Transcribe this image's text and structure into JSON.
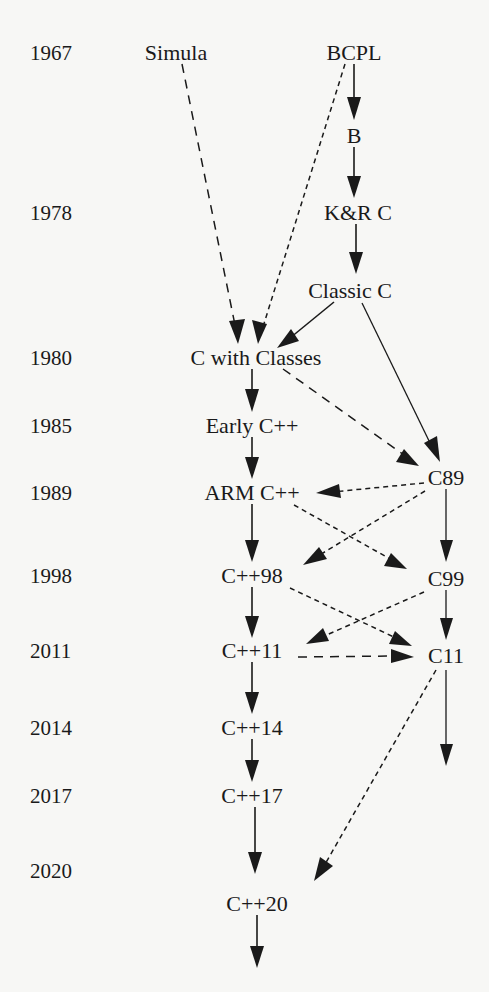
{
  "page": {
    "background_color": "#f7f7f5",
    "ink_color": "#1a1a1a",
    "width": 489,
    "height": 992
  },
  "years": [
    {
      "label": "1967",
      "x": 30,
      "y": 52
    },
    {
      "label": "1978",
      "x": 30,
      "y": 212
    },
    {
      "label": "1980",
      "x": 30,
      "y": 357
    },
    {
      "label": "1985",
      "x": 30,
      "y": 425
    },
    {
      "label": "1989",
      "x": 30,
      "y": 492
    },
    {
      "label": "1998",
      "x": 30,
      "y": 575
    },
    {
      "label": "2011",
      "x": 30,
      "y": 650
    },
    {
      "label": "2014",
      "x": 30,
      "y": 727
    },
    {
      "label": "2017",
      "x": 30,
      "y": 795
    },
    {
      "label": "2020",
      "x": 30,
      "y": 870
    }
  ],
  "nodes": [
    {
      "id": "simula",
      "label": "Simula",
      "cx": 176,
      "cy": 52,
      "column": "left"
    },
    {
      "id": "bcpl",
      "label": "BCPL",
      "cx": 354,
      "cy": 52,
      "column": "right"
    },
    {
      "id": "b",
      "label": "B",
      "cx": 354,
      "cy": 135,
      "column": "right"
    },
    {
      "id": "kandrc",
      "label": "K&R C",
      "cx": 358,
      "cy": 212,
      "column": "right"
    },
    {
      "id": "classicc",
      "label": "Classic C",
      "cx": 350,
      "cy": 290,
      "column": "right"
    },
    {
      "id": "cwithclasses",
      "label": "C with Classes",
      "cx": 256,
      "cy": 357,
      "column": "center"
    },
    {
      "id": "earlycpp",
      "label": "Early C++",
      "cx": 252,
      "cy": 425,
      "column": "center"
    },
    {
      "id": "armcpp",
      "label": "ARM C++",
      "cx": 252,
      "cy": 492,
      "column": "center"
    },
    {
      "id": "cpp98",
      "label": "C++98",
      "cx": 252,
      "cy": 575,
      "column": "center"
    },
    {
      "id": "cpp11",
      "label": "C++11",
      "cx": 252,
      "cy": 650,
      "column": "center"
    },
    {
      "id": "cpp14",
      "label": "C++14",
      "cx": 252,
      "cy": 727,
      "column": "center"
    },
    {
      "id": "cpp17",
      "label": "C++17",
      "cx": 252,
      "cy": 795,
      "column": "center"
    },
    {
      "id": "cpp20",
      "label": "C++20",
      "cx": 257,
      "cy": 903,
      "column": "center"
    },
    {
      "id": "c89",
      "label": "C89",
      "cx": 446,
      "cy": 477,
      "column": "right"
    },
    {
      "id": "c99",
      "label": "C99",
      "cx": 446,
      "cy": 578,
      "column": "right"
    },
    {
      "id": "c11",
      "label": "C11",
      "cx": 446,
      "cy": 655,
      "column": "right"
    }
  ],
  "edges": [
    {
      "id": "simula-to-cwithclasses",
      "from": "Simula",
      "to": "C with Classes",
      "style": "dashed-long"
    },
    {
      "id": "bcpl-to-b",
      "from": "BCPL",
      "to": "B",
      "style": "solid"
    },
    {
      "id": "bcpl-to-cwithclasses",
      "from": "BCPL",
      "to": "C with Classes",
      "style": "dashed-short"
    },
    {
      "id": "b-to-kandrc",
      "from": "B",
      "to": "K&R C",
      "style": "solid"
    },
    {
      "id": "kandrc-to-classicc",
      "from": "K&R C",
      "to": "Classic C",
      "style": "solid"
    },
    {
      "id": "classicc-to-cwithclasses",
      "from": "Classic C",
      "to": "C with Classes",
      "style": "solid"
    },
    {
      "id": "classicc-to-c89",
      "from": "Classic C",
      "to": "C89",
      "style": "solid"
    },
    {
      "id": "cwithclasses-to-earlycpp",
      "from": "C with Classes",
      "to": "Early C++",
      "style": "solid"
    },
    {
      "id": "cwithclasses-to-c89",
      "from": "C with Classes",
      "to": "C89",
      "style": "dashed-long"
    },
    {
      "id": "earlycpp-to-armcpp",
      "from": "Early C++",
      "to": "ARM C++",
      "style": "solid"
    },
    {
      "id": "c89-to-armcpp",
      "from": "C89",
      "to": "ARM C++",
      "style": "dashed-short"
    },
    {
      "id": "c89-to-cpp98",
      "from": "C89",
      "to": "C++98",
      "style": "dashed-short"
    },
    {
      "id": "c89-to-c99",
      "from": "C89",
      "to": "C99",
      "style": "solid-thin"
    },
    {
      "id": "armcpp-to-cpp98",
      "from": "ARM C++",
      "to": "C++98",
      "style": "solid"
    },
    {
      "id": "armcpp-to-c99",
      "from": "ARM C++",
      "to": "C99",
      "style": "dashed-short"
    },
    {
      "id": "cpp98-to-cpp11",
      "from": "C++98",
      "to": "C++11",
      "style": "solid"
    },
    {
      "id": "cpp98-to-c11",
      "from": "C++98",
      "to": "C11",
      "style": "dashed-short"
    },
    {
      "id": "c99-to-c11",
      "from": "C99",
      "to": "C11",
      "style": "solid-thin"
    },
    {
      "id": "c99-to-cpp11",
      "from": "C99",
      "to": "C++11",
      "style": "dashed-short"
    },
    {
      "id": "cpp11-to-c11",
      "from": "C++11",
      "to": "C11",
      "style": "dashed-long"
    },
    {
      "id": "cpp11-to-cpp14",
      "from": "C++11",
      "to": "C++14",
      "style": "solid"
    },
    {
      "id": "c11-to-cpp20",
      "from": "C11",
      "to": "C++20",
      "style": "dashed-short"
    },
    {
      "id": "c11-to-future",
      "from": "C11",
      "to": "(future C)",
      "style": "solid-thin"
    },
    {
      "id": "cpp14-to-cpp17",
      "from": "C++14",
      "to": "C++17",
      "style": "solid"
    },
    {
      "id": "cpp17-to-cpp20",
      "from": "C++17",
      "to": "C++20",
      "style": "solid"
    },
    {
      "id": "cpp20-to-future",
      "from": "C++20",
      "to": "(future C++)",
      "style": "solid"
    }
  ]
}
